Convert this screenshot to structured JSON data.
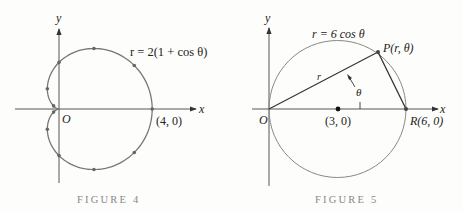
{
  "figures": [
    {
      "caption": "FIGURE 4",
      "equation": "r = 2(1 + cos θ)",
      "x_axis_label": "x",
      "y_axis_label": "y",
      "origin_label": "O",
      "point_label": "(4, 0)"
    },
    {
      "caption": "FIGURE 5",
      "equation": "r = 6 cos θ",
      "x_axis_label": "x",
      "y_axis_label": "y",
      "origin_label": "O",
      "center_label": "(3, 0)",
      "point_P_label": "P(r, θ)",
      "point_R_label": "R(6, 0)",
      "segment_label": "r",
      "angle_label": "θ"
    }
  ],
  "chart_data": [
    {
      "type": "line",
      "title": "FIGURE 4",
      "equation": "r = 2(1 + cos θ)",
      "curve": "cardioid",
      "xlabel": "x",
      "ylabel": "y",
      "marked_points_theta_deg": [
        0,
        30,
        60,
        90,
        120,
        150,
        210,
        240,
        270,
        300,
        330
      ],
      "annotations": [
        "O",
        "(4, 0)"
      ],
      "xlim": [
        -0.5,
        4
      ],
      "ylim": [
        -2.6,
        2.6
      ]
    },
    {
      "type": "line",
      "title": "FIGURE 5",
      "equation": "r = 6 cos θ",
      "curve": "circle",
      "center": [
        3,
        0
      ],
      "radius": 3,
      "xlabel": "x",
      "ylabel": "y",
      "points": {
        "O": [
          0,
          0
        ],
        "center": [
          3,
          0
        ],
        "R": [
          6,
          0
        ],
        "P_theta_deg": 30
      },
      "annotations": [
        "O",
        "(3, 0)",
        "P(r, θ)",
        "R(6, 0)",
        "r",
        "θ"
      ]
    }
  ]
}
